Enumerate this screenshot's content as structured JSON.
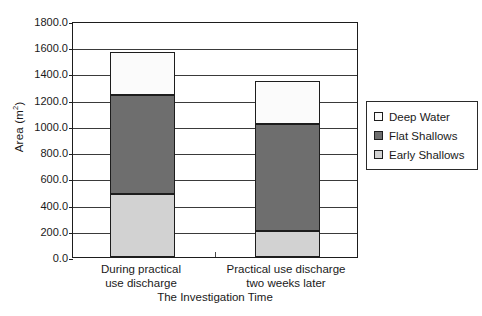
{
  "chart_data": {
    "type": "bar",
    "subtype": "stacked-bar",
    "title": "",
    "xlabel": "The Investigation Time",
    "ylabel": "Area (m²)",
    "ylabel_text": "Area (m",
    "ylabel_sup": "2",
    "ylabel_tail": ")",
    "categories": [
      "During practical use discharge",
      "Practical use discharge two weeks later"
    ],
    "category_lines": [
      [
        "During practical",
        "use discharge"
      ],
      [
        "Practical use discharge",
        "two weeks later"
      ]
    ],
    "series": [
      {
        "name": "Deep Water",
        "color": "#fbfbfb",
        "values": [
          325,
          330
        ]
      },
      {
        "name": "Flat Shallows",
        "color": "#6e6e6e",
        "values": [
          755,
          820
        ]
      },
      {
        "name": "Early Shallows",
        "color": "#d2d2d2",
        "values": [
          480,
          195
        ]
      }
    ],
    "stack_order_bottom_to_top": [
      "Early Shallows",
      "Flat Shallows",
      "Deep Water"
    ],
    "totals": [
      1560,
      1345
    ],
    "ylim": [
      0,
      1800
    ],
    "ytick_step": 200,
    "ytick_labels": [
      "1800.0",
      "1600.0",
      "1400.0",
      "1200.0",
      "1000.0",
      "800.0",
      "600.0",
      "400.0",
      "200.0",
      "0.0"
    ],
    "ytick_values": [
      1800,
      1600,
      1400,
      1200,
      1000,
      800,
      600,
      400,
      200,
      0
    ],
    "grid": true,
    "grid_axis": "y",
    "legend_position": "right",
    "legend_entries": [
      "Deep Water",
      "Flat Shallows",
      "Early Shallows"
    ],
    "axis_color": "#1d1d1d",
    "grid_color": "#3a3a3a",
    "background": "#ffffff"
  }
}
